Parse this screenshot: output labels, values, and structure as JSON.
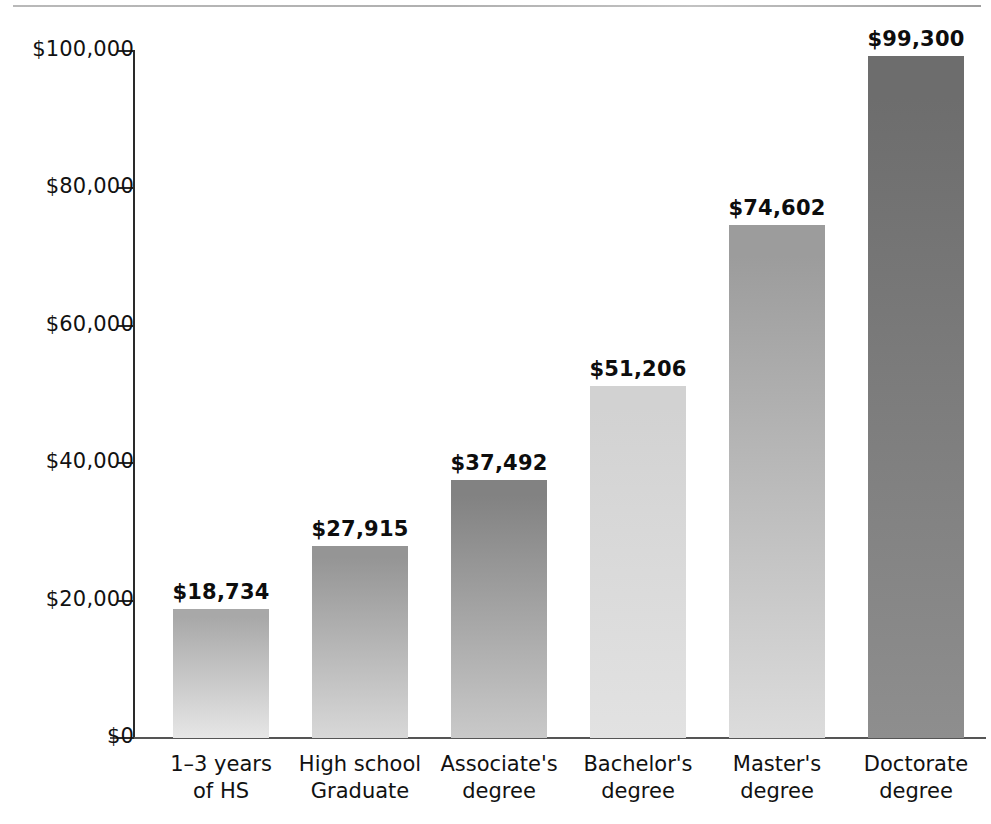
{
  "chart_data": {
    "type": "bar",
    "title": "",
    "subtitle": "",
    "xlabel": "",
    "ylabel": "",
    "ylim": [
      0,
      100000
    ],
    "grid": false,
    "legend": null,
    "categories": [
      "1–3 years of HS",
      "High school Graduate",
      "Associate's degree",
      "Bachelor's degree",
      "Master's degree",
      "Doctorate degree"
    ],
    "category_lines": [
      [
        "1–3 years",
        "of HS"
      ],
      [
        "High school",
        "Graduate"
      ],
      [
        "Associate's",
        "degree"
      ],
      [
        "Bachelor's",
        "degree"
      ],
      [
        "Master's",
        "degree"
      ],
      [
        "Doctorate",
        "degree"
      ]
    ],
    "values": [
      18734,
      27915,
      37492,
      51206,
      74602,
      99300
    ],
    "value_labels": [
      "$18,734",
      "$27,915",
      "$37,492",
      "$51,206",
      "$74,602",
      "$99,300"
    ],
    "ytick_values": [
      0,
      20000,
      40000,
      60000,
      80000,
      100000
    ],
    "ytick_labels": [
      "$0",
      "$20,000",
      "$40,000",
      "$60,000",
      "$80,000",
      "$100,000"
    ],
    "bar_colors_top": [
      "#a8a8a8",
      "#959595",
      "#828282",
      "#d2d2d2",
      "#9c9c9c",
      "#6d6d6d"
    ],
    "bar_colors_bottom": [
      "#e6e6e6",
      "#d8d8d8",
      "#c9c9c9",
      "#e2e2e2",
      "#dcdcdc",
      "#8e8e8e"
    ],
    "axis_color": "#2a2a2a",
    "baseline_color": "#555555",
    "rule_color": "#b0b0b0",
    "text_color": "#111111"
  }
}
